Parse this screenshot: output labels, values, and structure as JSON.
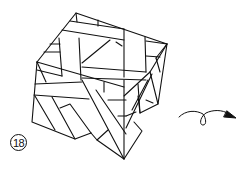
{
  "diagram": {
    "type": "origami-folding-step",
    "step_number": "18",
    "instruction_symbol": "turn-over-arrow",
    "line_color": "#111111",
    "background": "#ffffff"
  }
}
